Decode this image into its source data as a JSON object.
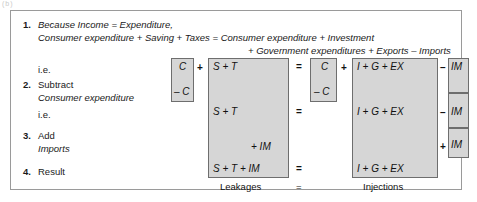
{
  "figure": {
    "artifact_text": "(b)",
    "steps": [
      {
        "number": "1.",
        "lines": [
          "Because Income  =  Expenditure,",
          "Consumer expenditure  +  Saving  +  Taxes  =  Consumer expenditure  +  Investment",
          "+ Government expenditures + Exports – Imports"
        ]
      },
      {
        "number": "",
        "lines": [
          "i.e."
        ]
      },
      {
        "number": "2.",
        "lines": [
          "Subtract",
          "Consumer expenditure"
        ]
      },
      {
        "number": "",
        "lines": [
          "i.e."
        ]
      },
      {
        "number": "3.",
        "lines": [
          "Add",
          "Imports"
        ]
      },
      {
        "number": "4.",
        "lines": [
          "Result"
        ]
      }
    ],
    "equation": {
      "row1": {
        "c_box": "C",
        "plus_after_c": "+",
        "leakages": "S  +  T",
        "equals": "=",
        "c_box_right": "C",
        "plus_after_c_right": "+",
        "injections": "I   +   G   +   EX",
        "minus": "–",
        "im": "IM"
      },
      "row2": {
        "c_minus": "– C",
        "c_minus_right": "– C"
      },
      "row3": {
        "leakages": "S   +   T",
        "equals": "=",
        "injections": "I    +    G    +    EX",
        "minus": "–",
        "im": "IM"
      },
      "row4": {
        "leakages_add": "+  IM",
        "plus": "+",
        "im": "IM"
      },
      "row5": {
        "leakages": "S   +   T  +  IM",
        "equals": "=",
        "injections": "I    +    G    +    EX"
      }
    },
    "captions": {
      "leakages": "Leakages",
      "equals": "=",
      "injections": "Injections"
    }
  }
}
